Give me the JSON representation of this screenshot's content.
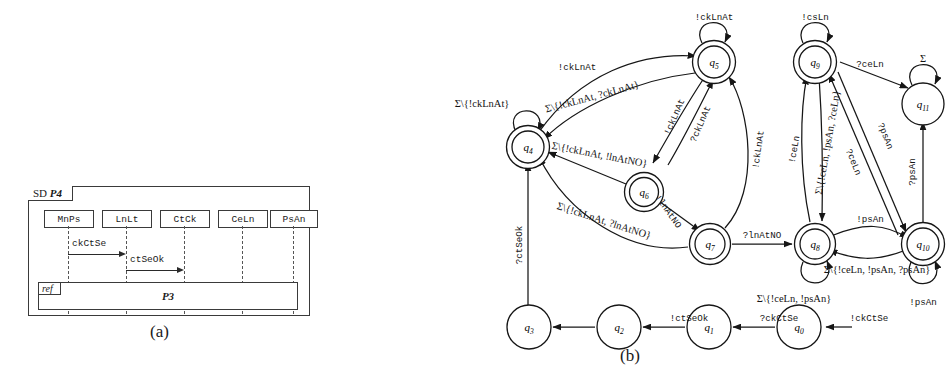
{
  "figure": {
    "caption_a": "(a)",
    "caption_b": "(b)"
  },
  "sequence_diagram": {
    "frame_kind": "SD",
    "frame_name": "P4",
    "lifelines": [
      {
        "name": "MnPs"
      },
      {
        "name": "LnLt"
      },
      {
        "name": "CtCk"
      },
      {
        "name": "CeLn"
      },
      {
        "name": "PsAn"
      }
    ],
    "messages": [
      {
        "label": "ckCtSe",
        "from": "MnPs",
        "to": "LnLt"
      },
      {
        "label": "ctSeOk",
        "from": "LnLt",
        "to": "CtCk"
      }
    ],
    "ref_fragment": {
      "operator": "ref",
      "name": "P3"
    }
  },
  "automaton": {
    "alphabet_symbol": "Σ",
    "states": [
      {
        "id": "q0",
        "label": "q",
        "sub": "0",
        "accepting": false,
        "initial": true
      },
      {
        "id": "q1",
        "label": "q",
        "sub": "1",
        "accepting": false,
        "initial": false
      },
      {
        "id": "q2",
        "label": "q",
        "sub": "2",
        "accepting": false,
        "initial": false
      },
      {
        "id": "q3",
        "label": "q",
        "sub": "3",
        "accepting": false,
        "initial": false
      },
      {
        "id": "q4",
        "label": "q",
        "sub": "4",
        "accepting": true,
        "initial": false
      },
      {
        "id": "q5",
        "label": "q",
        "sub": "5",
        "accepting": true,
        "initial": false
      },
      {
        "id": "q6",
        "label": "q",
        "sub": "6",
        "accepting": true,
        "initial": false
      },
      {
        "id": "q7",
        "label": "q",
        "sub": "7",
        "accepting": true,
        "initial": false
      },
      {
        "id": "q8",
        "label": "q",
        "sub": "8",
        "accepting": true,
        "initial": false
      },
      {
        "id": "q9",
        "label": "q",
        "sub": "9",
        "accepting": true,
        "initial": false
      },
      {
        "id": "q10",
        "label": "q",
        "sub": "10",
        "accepting": true,
        "initial": false
      },
      {
        "id": "q11",
        "label": "q",
        "sub": "11",
        "accepting": false,
        "initial": false
      }
    ],
    "transitions": [
      {
        "from": "q0",
        "to": "q1",
        "label": "!ckCtSe"
      },
      {
        "from": "q1",
        "to": "q2",
        "label": "?ckCtSe"
      },
      {
        "from": "q2",
        "to": "q3",
        "label": "!ctSeOk"
      },
      {
        "from": "q3",
        "to": "q4",
        "label": "?ctSeOk"
      },
      {
        "from": "q4",
        "to": "q4",
        "label": "Σ\\{!ckLnAt}"
      },
      {
        "from": "q4",
        "to": "q5",
        "label": "!ckLnAt"
      },
      {
        "from": "q5",
        "to": "q5",
        "label": "!ckLnAt"
      },
      {
        "from": "q5",
        "to": "q4",
        "label": "Σ\\{!ckLnAt, ?ckLnAt}"
      },
      {
        "from": "q5",
        "to": "q6",
        "label": "!ckLnAt"
      },
      {
        "from": "q6",
        "to": "q5",
        "label": "?ckLnAt"
      },
      {
        "from": "q6",
        "to": "q4",
        "label": "Σ\\{!ckLnAt, !lnAtNO}"
      },
      {
        "from": "q6",
        "to": "q7",
        "label": "!lnAtNO"
      },
      {
        "from": "q7",
        "to": "q5",
        "label": "!ckLnAt"
      },
      {
        "from": "q7",
        "to": "q4",
        "label": "Σ\\{!ckLnAt, ?lnAtNO}"
      },
      {
        "from": "q7",
        "to": "q8",
        "label": "?lnAtNO"
      },
      {
        "from": "q8",
        "to": "q8",
        "label": "Σ\\{!ceLn, !psAn}"
      },
      {
        "from": "q8",
        "to": "q9",
        "label": "Σ\\{!ceLn, !psAn, ?ceLn}"
      },
      {
        "from": "q9",
        "to": "q9",
        "label": "!csLn"
      },
      {
        "from": "q9",
        "to": "q8",
        "label": "!ceLn"
      },
      {
        "from": "q9",
        "to": "q11",
        "label": "?ceLn"
      },
      {
        "from": "q9",
        "to": "q10",
        "label": "?psAn"
      },
      {
        "from": "q10",
        "to": "q9",
        "label": "?ceLn"
      },
      {
        "from": "q8",
        "to": "q10",
        "label": "!psAn"
      },
      {
        "from": "q10",
        "to": "q8",
        "label": "Σ\\{!ceLn, !psAn, ?psAn}"
      },
      {
        "from": "q10",
        "to": "q10",
        "label": "!psAn"
      },
      {
        "from": "q10",
        "to": "q11",
        "label": "?psAn"
      },
      {
        "from": "q11",
        "to": "q11",
        "label": "Σ"
      }
    ]
  }
}
